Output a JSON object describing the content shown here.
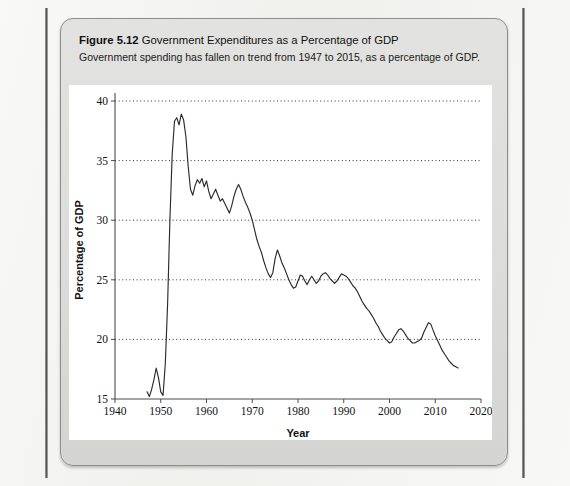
{
  "figure": {
    "label": "Figure 5.12",
    "title": "Government Expenditures as a Percentage of GDP",
    "subtitle": "Government spending has fallen on trend from 1947 to 2015, as a percentage of GDP."
  },
  "colors": {
    "page_background": "#f1f1ee",
    "figure_box": "#dcdcda",
    "figure_border": "#8d8d8b",
    "plot_panel": "#ffffff",
    "line": "#2b2b2b",
    "grid": "#333333",
    "axis": "#4c4c4c"
  },
  "chart_data": {
    "type": "line",
    "title": "Government Expenditures as a Percentage of GDP",
    "subtitle": "Government spending has fallen on trend from 1947 to 2015, as a percentage of GDP.",
    "xlabel": "Year",
    "ylabel": "Percentage of GDP",
    "xlim": [
      1940,
      2020
    ],
    "ylim": [
      15,
      40
    ],
    "xticks": [
      1940,
      1950,
      1960,
      1970,
      1980,
      1990,
      2000,
      2010,
      2020
    ],
    "yticks": [
      15,
      20,
      25,
      30,
      35,
      40
    ],
    "grid": "horizontal-dotted",
    "legend": "none",
    "series": [
      {
        "name": "Government expenditures (% of GDP)",
        "x": [
          1947,
          1947.5,
          1948,
          1948.5,
          1949,
          1949.5,
          1950,
          1950.5,
          1951,
          1951.5,
          1952,
          1952.5,
          1953,
          1953.5,
          1954,
          1954.5,
          1955,
          1955.5,
          1956,
          1956.5,
          1957,
          1957.5,
          1958,
          1958.5,
          1959,
          1959.5,
          1960,
          1960.5,
          1961,
          1961.5,
          1962,
          1962.5,
          1963,
          1963.5,
          1964,
          1964.5,
          1965,
          1965.5,
          1966,
          1966.5,
          1967,
          1967.5,
          1968,
          1968.5,
          1969,
          1969.5,
          1970,
          1970.5,
          1971,
          1971.5,
          1972,
          1972.5,
          1973,
          1973.5,
          1974,
          1974.5,
          1975,
          1975.5,
          1976,
          1976.5,
          1977,
          1977.5,
          1978,
          1978.5,
          1979,
          1979.5,
          1980,
          1980.5,
          1981,
          1981.5,
          1982,
          1982.5,
          1983,
          1983.5,
          1984,
          1984.5,
          1985,
          1985.5,
          1986,
          1986.5,
          1987,
          1987.5,
          1988,
          1988.5,
          1989,
          1989.5,
          1990,
          1990.5,
          1991,
          1991.5,
          1992,
          1992.5,
          1993,
          1993.5,
          1994,
          1994.5,
          1995,
          1995.5,
          1996,
          1996.5,
          1997,
          1997.5,
          1998,
          1998.5,
          1999,
          1999.5,
          2000,
          2000.5,
          2001,
          2001.5,
          2002,
          2002.5,
          2003,
          2003.5,
          2004,
          2004.5,
          2005,
          2005.5,
          2006,
          2006.5,
          2007,
          2007.5,
          2008,
          2008.5,
          2009,
          2009.5,
          2010,
          2010.5,
          2011,
          2011.5,
          2012,
          2012.5,
          2013,
          2013.5,
          2014,
          2014.5,
          2015
        ],
        "y": [
          15.6,
          15.2,
          15.8,
          16.6,
          17.6,
          16.8,
          15.6,
          15.3,
          18.0,
          23.0,
          30.0,
          35.5,
          38.3,
          38.6,
          38.0,
          38.9,
          38.4,
          37.0,
          34.5,
          32.6,
          32.1,
          32.9,
          33.4,
          33.1,
          33.5,
          32.8,
          33.3,
          32.4,
          31.8,
          32.2,
          32.6,
          32.1,
          31.6,
          31.8,
          31.4,
          31.0,
          30.6,
          31.2,
          32.0,
          32.6,
          33.0,
          32.6,
          32.0,
          31.5,
          31.1,
          30.6,
          30.0,
          29.2,
          28.4,
          27.8,
          27.3,
          26.6,
          26.0,
          25.5,
          25.2,
          25.6,
          26.8,
          27.5,
          27.0,
          26.4,
          26.0,
          25.5,
          25.0,
          24.6,
          24.3,
          24.4,
          24.9,
          25.4,
          25.3,
          24.9,
          24.6,
          25.0,
          25.3,
          25.0,
          24.7,
          24.9,
          25.3,
          25.5,
          25.6,
          25.4,
          25.1,
          24.9,
          24.7,
          24.9,
          25.2,
          25.5,
          25.4,
          25.3,
          25.1,
          24.8,
          24.5,
          24.3,
          24.0,
          23.6,
          23.2,
          22.9,
          22.6,
          22.4,
          22.1,
          21.8,
          21.4,
          21.1,
          20.7,
          20.4,
          20.1,
          19.9,
          19.7,
          19.8,
          20.2,
          20.5,
          20.8,
          20.9,
          20.7,
          20.4,
          20.1,
          19.9,
          19.7,
          19.7,
          19.8,
          19.9,
          20.1,
          20.6,
          21.0,
          21.4,
          21.3,
          20.8,
          20.3,
          19.9,
          19.5,
          19.1,
          18.8,
          18.5,
          18.2,
          18.0,
          17.8,
          17.7,
          17.6
        ]
      }
    ]
  }
}
